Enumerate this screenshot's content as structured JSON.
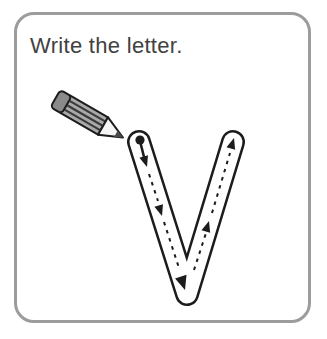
{
  "card": {
    "title": "Write the letter.",
    "letter": "V"
  },
  "trace": {
    "start_marker": "dot",
    "stroke1_direction": "down",
    "stroke2_direction": "up",
    "arrow_count": "5"
  },
  "colors": {
    "border": "#9c9c9c",
    "title_text": "#414141",
    "letter_outline": "#1c1c1c",
    "letter_fill": "#ffffff",
    "trace_marks": "#1c1c1c",
    "pencil_body": "#a9a9a9",
    "pencil_eraser": "#8a8a8a",
    "pencil_stripes": "#3b3b3b",
    "pencil_tip": "#f5f5f5",
    "pencil_lead": "#4a4a4a"
  }
}
